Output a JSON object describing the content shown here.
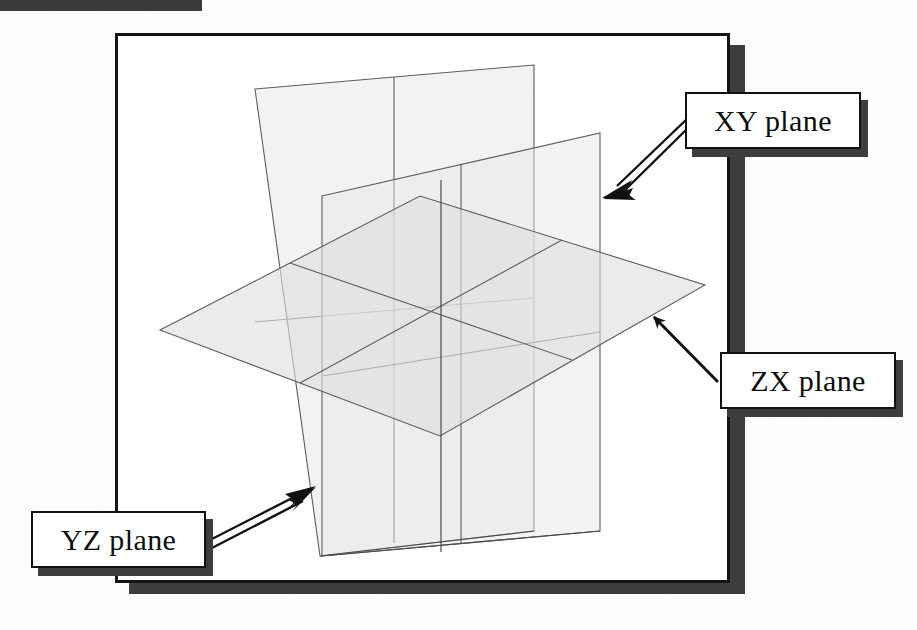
{
  "figure": {
    "background_color": "#ffffff",
    "ink_color": "#111111",
    "shadow_color": "#3d3d3d",
    "plane_fill_color": "#e3e3e3",
    "plane_edge_color": "#5a5a5a"
  },
  "frame": {
    "border_color": "#151515",
    "shadow_color": "#3d3d3d"
  },
  "callouts": [
    {
      "id": "xy",
      "label": "XY plane",
      "arrow_style": "hollow-double-line",
      "arrow_direction": "down-left",
      "points_to": "vertical XY plane right edge"
    },
    {
      "id": "zx",
      "label": "ZX plane",
      "arrow_style": "solid-thin-line",
      "arrow_direction": "up-left",
      "points_to": "horizontal ZX plane right corner"
    },
    {
      "id": "yz",
      "label": "YZ plane",
      "arrow_style": "hollow-double-line",
      "arrow_direction": "up-right",
      "points_to": "vertical YZ plane lower-left edge"
    }
  ],
  "planes": {
    "xy_plane": {
      "name": "XY plane",
      "orientation": "vertical, receding to the right",
      "fill": "#e6e6e6",
      "opacity": 0.55,
      "vertices": "255,89 534,65 534,531 320,556",
      "grid_divisions": 2
    },
    "zx_plane": {
      "name": "ZX plane",
      "orientation": "horizontal",
      "fill": "#e2e2e2",
      "opacity": 0.6,
      "vertices": "160,330 420,196 705,285 440,436",
      "grid_divisions": 2
    },
    "yz_plane": {
      "name": "YZ plane",
      "orientation": "vertical, receding to the left",
      "fill": "#e6e6e6",
      "opacity": 0.55,
      "vertices": "322,196 600,133 600,531 322,556",
      "grid_divisions": 2
    }
  },
  "scan_artifact": {
    "name": "top-edge-scan-bar",
    "color": "#3a3a3a"
  }
}
